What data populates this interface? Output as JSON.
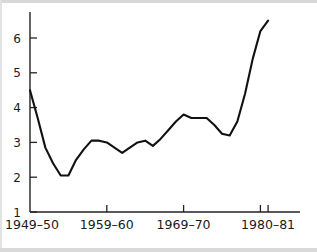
{
  "chart_data": {
    "type": "line",
    "title": "",
    "subtitle": "",
    "xlabel": "",
    "ylabel": "",
    "xlim": [
      0,
      31
    ],
    "ylim": [
      1,
      6.8
    ],
    "grid": false,
    "legend": false,
    "legend_position": "none",
    "y_ticks": [
      1,
      2,
      3,
      4,
      5,
      6
    ],
    "y_tick_labels": [
      "1",
      "2",
      "3",
      "4",
      "5",
      "6"
    ],
    "x_tick_labels": [
      "1949–50",
      "1959–60",
      "1969–70",
      "1980–81"
    ],
    "x_tick_indices": [
      0,
      10,
      20,
      31
    ],
    "x_extra_tick_indices": [
      30
    ],
    "categories": [
      "1949–50",
      "1950–51",
      "1951–52",
      "1952–53",
      "1953–54",
      "1954–55",
      "1955–56",
      "1956–57",
      "1957–58",
      "1958–59",
      "1959–60",
      "1960–61",
      "1961–62",
      "1962–63",
      "1963–64",
      "1964–65",
      "1965–66",
      "1966–67",
      "1967–68",
      "1968–69",
      "1969–70",
      "1970–71",
      "1971–72",
      "1972–73",
      "1973–74",
      "1974–75",
      "1975–76",
      "1976–77",
      "1977–78",
      "1978–79",
      "1979–80",
      "1980–81"
    ],
    "values": [
      4.5,
      3.7,
      2.85,
      2.4,
      2.05,
      2.05,
      2.5,
      2.8,
      3.05,
      3.05,
      3.0,
      2.85,
      2.7,
      2.85,
      3.0,
      3.05,
      2.9,
      3.1,
      3.35,
      3.6,
      3.8,
      3.7,
      3.7,
      3.7,
      3.5,
      3.25,
      3.2,
      3.6,
      4.4,
      5.4,
      6.2,
      6.5
    ],
    "line_color": "#111111",
    "axis_color": "#222222",
    "background_color": "#ffffff"
  },
  "geometry": {
    "plot_left": 30,
    "plot_right": 300,
    "plot_bottom": 212,
    "plot_top": 12,
    "x_step": 7.68,
    "y_unit_px": 34.8,
    "y_base_value": 1
  }
}
